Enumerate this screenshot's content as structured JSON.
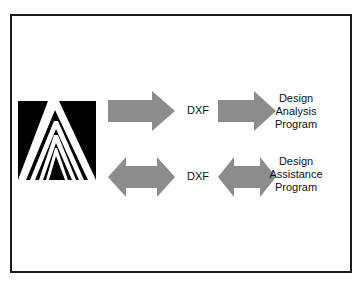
{
  "diagram": {
    "logo": {
      "name": "A-logo",
      "description": "stylized white letter A chevrons on black square"
    },
    "rows": [
      {
        "arrow_type": "single-right",
        "format_label": "DXF",
        "target_lines": [
          "Design",
          "Analysis",
          "Program"
        ]
      },
      {
        "arrow_type": "double-left-right",
        "format_label": "DXF",
        "target_lines": [
          "Design",
          "Assistance",
          "Program"
        ]
      }
    ],
    "colors": {
      "arrow_fill": "#8c8c8c",
      "frame": "#1a1a1a",
      "logo_bg": "#000000",
      "logo_fg": "#ffffff"
    }
  }
}
